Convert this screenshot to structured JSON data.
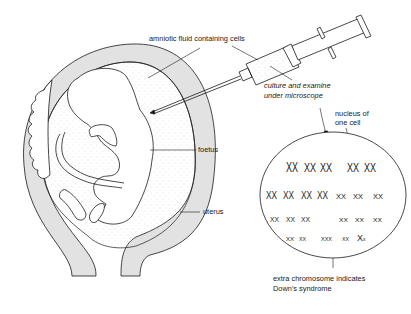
{
  "diagram": {
    "labels": {
      "amniotic_fluid": "amniotic fluid containing cells",
      "culture_line1": "culture and examine",
      "culture_line2": "under microscope",
      "nucleus_line1": "nucleus of",
      "nucleus_line2": "one cell",
      "foetus": "foetus",
      "uterus": "uterus",
      "extra_line1": "extra chromosome indicates",
      "extra_line2": "Down's syndrome"
    },
    "components": [
      "uterus",
      "placenta",
      "amniotic-fluid",
      "foetus",
      "syringe",
      "cell-nucleus",
      "chromosomes"
    ],
    "chromosome_rows": [
      {
        "row": 1,
        "groups": 5
      },
      {
        "row": 2,
        "groups": 7
      },
      {
        "row": 3,
        "groups": 6
      },
      {
        "row": 4,
        "groups": 5,
        "note": "trisomy 21 group highlighted by arrow"
      }
    ],
    "colors": {
      "line": "#1a1a1a",
      "uterus_wall": "#e2e2e2",
      "fluid_stipple": "#c8c8c8",
      "background": "#ffffff"
    }
  }
}
